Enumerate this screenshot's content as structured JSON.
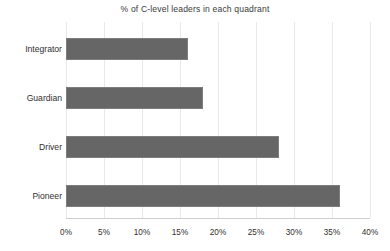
{
  "chart_data": {
    "type": "bar",
    "orientation": "horizontal",
    "title": "% of C-level leaders in each quadrant",
    "xlabel": "",
    "ylabel": "",
    "categories": [
      "Integrator",
      "Guardian",
      "Driver",
      "Pioneer"
    ],
    "values": [
      16,
      18,
      28,
      36
    ],
    "value_suffix": "%",
    "xlim": [
      0,
      40
    ],
    "xticks": [
      0,
      5,
      10,
      15,
      20,
      25,
      30,
      35,
      40
    ],
    "xtick_labels": [
      "0%",
      "5%",
      "10%",
      "15%",
      "20%",
      "25%",
      "30%",
      "35%",
      "40%"
    ],
    "grid": "vertical",
    "legend": "none",
    "series": [
      {
        "name": "% of C-level leaders",
        "values": [
          16,
          18,
          28,
          36
        ]
      }
    ],
    "colors": {
      "bar_fill": "#666666",
      "bar_border": "#7d7d7d",
      "gridline": "#e9e9e9",
      "axis_line": "#cfcfcf",
      "text": "#2f2f2f",
      "title_text": "#3a3a3a",
      "background": "#ffffff"
    }
  }
}
